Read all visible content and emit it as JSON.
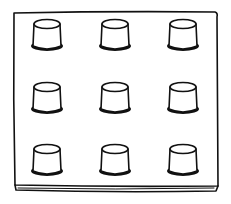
{
  "illustration": {
    "subject": "pegboard",
    "background": "#ffffff",
    "ink_color": "#111111",
    "board": {
      "left": 14,
      "top": 12,
      "right": 217,
      "bottom": 186,
      "thickness": 6
    },
    "pegs": {
      "rows": 3,
      "cols": 3,
      "centers_x": [
        47,
        115,
        183
      ],
      "centers_y": [
        35,
        98,
        160
      ],
      "top_rx": 13,
      "top_ry": 4.5,
      "height": 22,
      "bottom_half_width": 14,
      "base_rx": 16,
      "base_ry": 5
    }
  }
}
